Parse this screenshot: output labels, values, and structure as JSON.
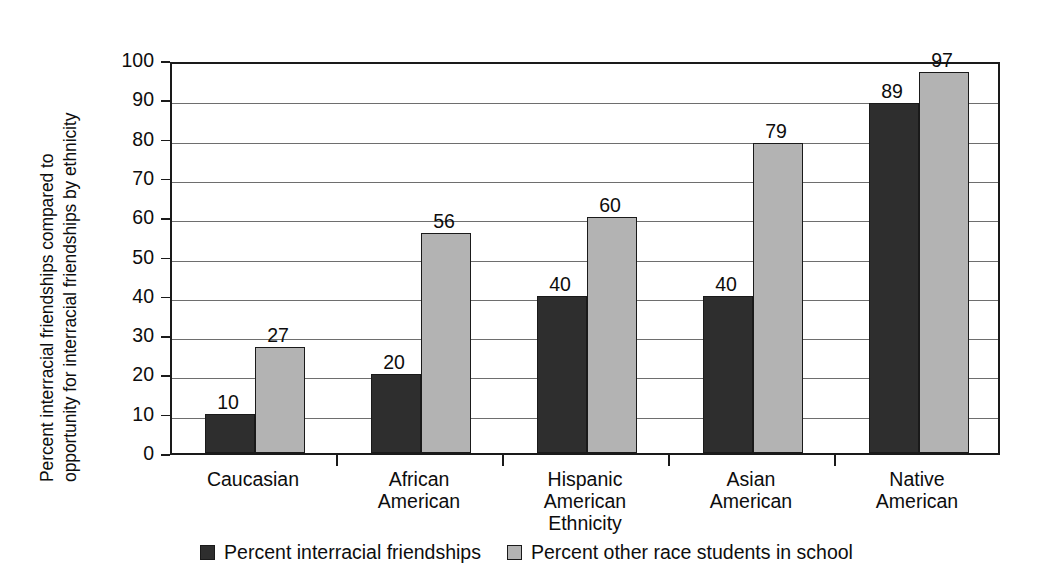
{
  "chart_data": {
    "type": "bar",
    "title": "",
    "xlabel": "Ethnicity",
    "ylabel": "Percent interracial friendships compared to opportunity for interracial friendships by ethnicity",
    "ylabel_lines": [
      "Percent interracial friendships compared to",
      "opportunity for interracial friendships by ethnicity"
    ],
    "categories": [
      "Caucasian",
      "African American",
      "Hispanic American",
      "Asian American",
      "Native American"
    ],
    "category_lines": [
      [
        "Caucasian"
      ],
      [
        "African",
        "American"
      ],
      [
        "Hispanic",
        "American"
      ],
      [
        "Asian",
        "American"
      ],
      [
        "Native",
        "American"
      ]
    ],
    "series": [
      {
        "name": "Percent interracial friendships",
        "color": "#2e2e2e",
        "values": [
          10,
          20,
          40,
          40,
          89
        ]
      },
      {
        "name": "Percent other race students in school",
        "color": "#b3b3b3",
        "values": [
          27,
          56,
          60,
          79,
          97
        ]
      }
    ],
    "ylim": [
      0,
      100
    ],
    "yticks": [
      0,
      10,
      20,
      30,
      40,
      50,
      60,
      70,
      80,
      90,
      100
    ],
    "ytick_labels": [
      "0",
      "10",
      "20",
      "30",
      "40",
      "50",
      "60",
      "70",
      "80",
      "90",
      "100"
    ],
    "grid": true,
    "grid_axis": "y",
    "legend_position": "bottom-center",
    "value_labels": true
  },
  "legend": {
    "items": [
      {
        "label": "Percent interracial friendships",
        "swatch": "dark"
      },
      {
        "label": "Percent other race students in school",
        "swatch": "light"
      }
    ]
  }
}
